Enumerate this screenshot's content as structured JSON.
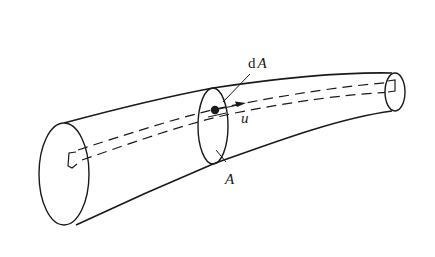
{
  "figure": {
    "type": "streamtube-diagram",
    "colors": {
      "stroke": "#1a1a1a",
      "background": "#ffffff"
    },
    "labels": {
      "dA_prefix": "d",
      "dA_symbol": "A",
      "velocity": "u",
      "area": "A"
    },
    "elements": [
      {
        "name": "inlet-section",
        "shape": "ellipse"
      },
      {
        "name": "middle-section",
        "shape": "ellipse",
        "label": "A"
      },
      {
        "name": "outlet-section",
        "shape": "ellipse"
      },
      {
        "name": "elemental-streamtube",
        "shape": "dashed-lines"
      },
      {
        "name": "elemental-area",
        "shape": "dot",
        "label": "dA"
      },
      {
        "name": "velocity-vector",
        "shape": "arrow",
        "label": "u"
      }
    ]
  }
}
